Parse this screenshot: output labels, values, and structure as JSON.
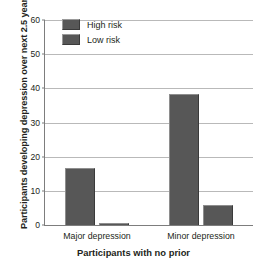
{
  "chart_data": {
    "type": "bar",
    "title": "",
    "categories": [
      "Major depression",
      "Minor depression"
    ],
    "series": [
      {
        "name": "High risk",
        "values": [
          16.6,
          38.2
        ],
        "color": "#575757"
      },
      {
        "name": "Low risk",
        "values": [
          0.7,
          5.8
        ],
        "color": "#575757"
      }
    ],
    "xlabel": "Participants with no prior",
    "ylabel": "Participants developing depression over next 2.5 years (%)",
    "ylim": [
      0,
      60
    ],
    "yticks": [
      0,
      10,
      20,
      30,
      40,
      50,
      60
    ],
    "ytick_labels": [
      "0",
      "10",
      "20",
      "30",
      "40",
      "50",
      "60"
    ],
    "grid": "horizontal",
    "legend_position": "top-left",
    "legend_entries": [
      "High risk",
      "Low risk"
    ]
  }
}
